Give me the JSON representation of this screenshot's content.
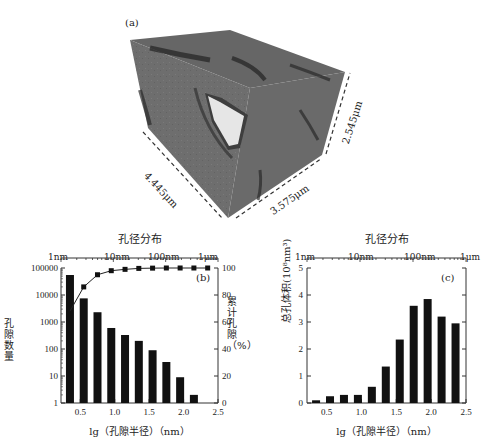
{
  "panel_a": {
    "label": "(a)",
    "dimensions": [
      "4.445μm",
      "3.575μm",
      "2.545μm"
    ]
  },
  "chart_data": [
    {
      "type": "bar",
      "panel": "(b)",
      "title": "孔径分布",
      "xlabel": "lg（孔隙半径）（nm）",
      "ylabel": "孔隙数量",
      "y2label": "累计孔隙（%）",
      "xlim": [
        0.22,
        2.5
      ],
      "ylim": [
        1,
        100000
      ],
      "yscale": "log",
      "y2lim": [
        0,
        100
      ],
      "x_ticks": [
        "0.5",
        "1.0",
        "1.5",
        "2.0",
        "2.5"
      ],
      "y_ticks": [
        "1",
        "10",
        "100",
        "1000",
        "10000",
        "100000"
      ],
      "y2_ticks": [
        "0",
        "20",
        "40",
        "60",
        "80",
        "100"
      ],
      "top_axis_ticks": [
        "1nm",
        "10nm",
        "100nm",
        "1μm"
      ],
      "x": [
        0.35,
        0.55,
        0.75,
        0.95,
        1.15,
        1.35,
        1.55,
        1.75,
        1.95,
        2.15
      ],
      "series": [
        {
          "name": "孔隙数量",
          "type": "bar",
          "values": [
            55000,
            7500,
            2300,
            600,
            330,
            200,
            90,
            33,
            9,
            2
          ]
        },
        {
          "name": "累计孔隙",
          "type": "line",
          "axis": "right",
          "x": [
            0.35,
            0.55,
            0.75,
            0.95,
            1.15,
            1.35,
            1.55,
            1.75,
            1.95,
            2.15,
            2.35
          ],
          "values": [
            68,
            86,
            95,
            98,
            99,
            99.7,
            99.9,
            100,
            100,
            100,
            100
          ]
        }
      ]
    },
    {
      "type": "bar",
      "panel": "(c)",
      "title": "孔径分布",
      "xlabel": "lg（孔隙半径）（nm）",
      "ylabel": "总孔体积(10⁸nm³)",
      "xlim": [
        0.22,
        2.5
      ],
      "ylim": [
        0,
        5
      ],
      "x_ticks": [
        "0.5",
        "1.0",
        "1.5",
        "2.0",
        "2.5"
      ],
      "y_ticks": [
        "0",
        "1",
        "2",
        "3",
        "4",
        "5"
      ],
      "top_axis_ticks": [
        "1nm",
        "10nm",
        "100nm",
        "1μm"
      ],
      "x": [
        0.35,
        0.55,
        0.75,
        0.95,
        1.15,
        1.35,
        1.55,
        1.75,
        1.95,
        2.15,
        2.35
      ],
      "values": [
        0.1,
        0.25,
        0.3,
        0.3,
        0.6,
        1.35,
        2.35,
        3.6,
        3.85,
        3.2,
        2.95
      ]
    }
  ]
}
